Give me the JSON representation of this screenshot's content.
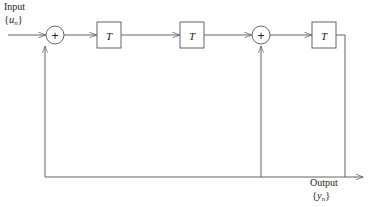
{
  "diagram": {
    "type": "signal-flow-block-diagram",
    "background_color": "#ffffff",
    "line_color": "#545454",
    "text_color": "#1a1a1a",
    "input": {
      "label": "Input",
      "signal_open": "{",
      "signal_var": "u",
      "signal_sub": "n",
      "signal_close": "}"
    },
    "output": {
      "label": "Output",
      "signal_open": "{",
      "signal_var": "y",
      "signal_sub": "n",
      "signal_close": "}"
    },
    "blocks": [
      {
        "name": "delay-block-1",
        "label": "T",
        "x": 97,
        "y": 22,
        "w": 24,
        "h": 26
      },
      {
        "name": "delay-block-2",
        "label": "T",
        "x": 180,
        "y": 22,
        "w": 24,
        "h": 26
      },
      {
        "name": "delay-block-3",
        "label": "T",
        "x": 312,
        "y": 22,
        "w": 24,
        "h": 26
      }
    ],
    "adders": [
      {
        "name": "summing-junction-1",
        "label": "+",
        "cx": 55,
        "cy": 35,
        "r": 9
      },
      {
        "name": "summing-junction-2",
        "label": "+",
        "cx": 261,
        "cy": 35,
        "r": 9
      }
    ],
    "main_line_y": 35,
    "feedback_line_y": 177,
    "feedback_left_x": 45,
    "feedback_mid_x": 261,
    "feedback_right_x": 345,
    "output_arrow_x": 372
  }
}
